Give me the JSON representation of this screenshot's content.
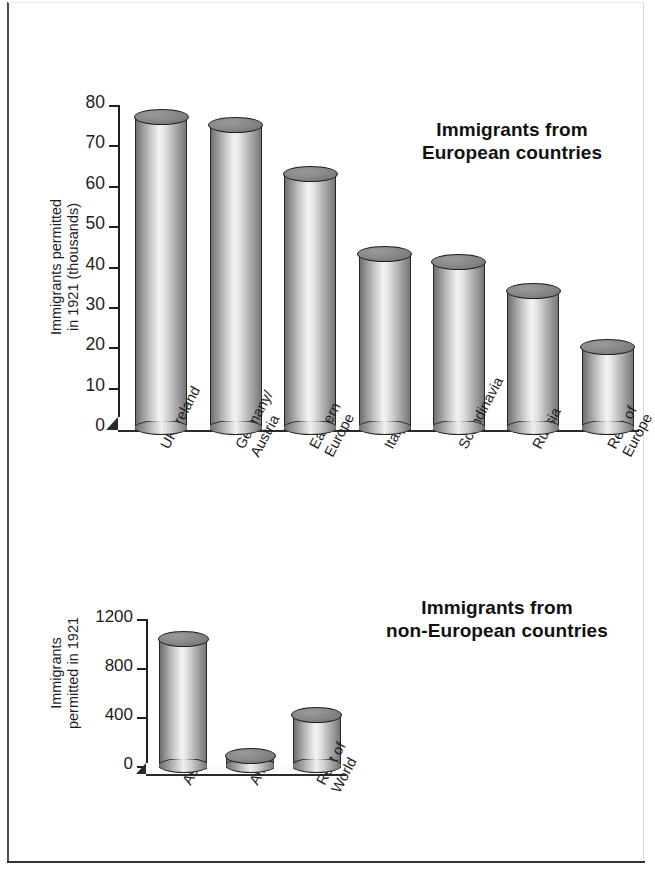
{
  "chart_data": [
    {
      "type": "bar",
      "title": "Immigrants from European countries",
      "title_line1": "Immigrants from",
      "title_line2": "European countries",
      "ylabel": "Immigrants permitted in 1921 (thousands)",
      "ylabel_line1": "Immigrants permitted",
      "ylabel_line2": "in 1921 (thousands)",
      "xlabel": "",
      "ylim": [
        0,
        80
      ],
      "yticks": [
        0,
        10,
        20,
        30,
        40,
        50,
        60,
        70,
        80
      ],
      "ytick_labels": [
        "0",
        "10",
        "20",
        "30",
        "40",
        "50",
        "60",
        "70",
        "80"
      ],
      "grid": false,
      "legend": "none",
      "categories": [
        "UK/Ireland",
        "Germany/Austria",
        "Eastern Europe",
        "Italy",
        "Scandinavia",
        "Russia",
        "Rest of Europe"
      ],
      "category_lines": [
        [
          "UK/Ireland",
          ""
        ],
        [
          "Germany/",
          "Austria"
        ],
        [
          "Eastern",
          "Europe"
        ],
        [
          "Italy",
          ""
        ],
        [
          "Scandinavia",
          ""
        ],
        [
          "Russia",
          ""
        ],
        [
          "Rest of",
          "Europe"
        ]
      ],
      "values": [
        79,
        77,
        65,
        45,
        43,
        36,
        22
      ],
      "units": "thousands"
    },
    {
      "type": "bar",
      "title": "Immigrants from non-European countries",
      "title_line1": "Immigrants from",
      "title_line2": "non-European countries",
      "ylabel": "Immigrants permitted in 1921",
      "ylabel_line1": "Immigrants",
      "ylabel_line2": "permitted in 1921",
      "xlabel": "",
      "ylim": [
        0,
        1200
      ],
      "yticks": [
        0,
        400,
        800,
        1200
      ],
      "ytick_labels": [
        "0",
        "400",
        "800",
        "1200"
      ],
      "grid": false,
      "legend": "none",
      "categories": [
        "Asia",
        "Africa",
        "Rest of World"
      ],
      "category_lines": [
        [
          "Asia",
          ""
        ],
        [
          "Africa",
          ""
        ],
        [
          "Rest of",
          "World"
        ]
      ],
      "values": [
        1100,
        150,
        480
      ],
      "units": "people"
    }
  ],
  "colors": {
    "ink": "#1a1a1a",
    "axis": "#1f1f1f",
    "cylinder_light": "#f3f3f3",
    "cylinder_dark": "#6f6f6f",
    "cylinder_cap": "#7d7d7d",
    "frame": "#333333",
    "background": "#ffffff"
  }
}
